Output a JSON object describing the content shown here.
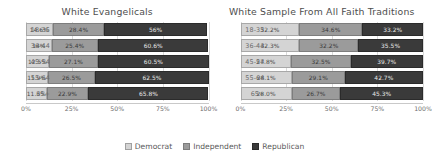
{
  "chart_data": [
    {
      "type": "bar",
      "orientation": "horizontal",
      "stacked": true,
      "normalized": true,
      "title": "White Evangelicals",
      "xlabel": "",
      "ylabel": "",
      "xlim": [
        0,
        100
      ],
      "xticks": [
        "0%",
        "25%",
        "50%",
        "75%",
        "100%"
      ],
      "xtick_values": [
        0,
        25,
        50,
        75,
        100
      ],
      "grid": true,
      "legend_position": "bottom",
      "categories": [
        "18-35",
        "36-44",
        "45-54",
        "55-64",
        "65+"
      ],
      "series": [
        {
          "name": "Democrat",
          "values": [
            14.6,
            14.0,
            12.5,
            11.9,
            11.3
          ],
          "labels": [
            "14.6%",
            "14%",
            "12.5%",
            "11.9%",
            "11.3%"
          ]
        },
        {
          "name": "Independent",
          "values": [
            28.4,
            25.4,
            27.1,
            26.5,
            22.9
          ],
          "labels": [
            "28.4%",
            "25.4%",
            "27.1%",
            "26.5%",
            "22.9%"
          ]
        },
        {
          "name": "Republican",
          "values": [
            56.0,
            60.6,
            60.5,
            62.5,
            65.8
          ],
          "labels": [
            "56%",
            "60.6%",
            "60.5%",
            "62.5%",
            "65.8%"
          ]
        }
      ]
    },
    {
      "type": "bar",
      "orientation": "horizontal",
      "stacked": true,
      "normalized": true,
      "title": "White Sample From All Faith Traditions",
      "xlabel": "",
      "ylabel": "",
      "xlim": [
        0,
        100
      ],
      "xticks": [
        "0%",
        "25%",
        "50%",
        "75%",
        "100%"
      ],
      "xtick_values": [
        0,
        25,
        50,
        75,
        100
      ],
      "grid": true,
      "legend_position": "bottom",
      "categories": [
        "18-35",
        "36-44",
        "45-54",
        "55-64",
        "65+"
      ],
      "series": [
        {
          "name": "Democrat",
          "values": [
            32.2,
            32.3,
            27.8,
            28.1,
            28.0
          ],
          "labels": [
            "32.2%",
            "32.3%",
            "27.8%",
            "28.1%",
            "28.0%"
          ]
        },
        {
          "name": "Independent",
          "values": [
            34.6,
            32.2,
            32.5,
            29.1,
            26.7
          ],
          "labels": [
            "34.6%",
            "32.2%",
            "32.5%",
            "29.1%",
            "26.7%"
          ]
        },
        {
          "name": "Republican",
          "values": [
            33.2,
            35.5,
            39.7,
            42.7,
            45.3
          ],
          "labels": [
            "33.2%",
            "35.5%",
            "39.7%",
            "42.7%",
            "45.3%"
          ]
        }
      ]
    }
  ],
  "legend": {
    "items": [
      {
        "label": "Democrat",
        "color": "#d4d4d4",
        "swatch": "swatch-dem"
      },
      {
        "label": "Independent",
        "color": "#9b9b9b",
        "swatch": "swatch-ind"
      },
      {
        "label": "Republican",
        "color": "#3a3a3a",
        "swatch": "swatch-rep"
      }
    ]
  }
}
